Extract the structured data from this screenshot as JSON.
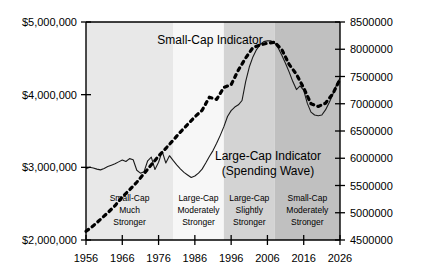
{
  "chart_data": {
    "type": "line",
    "title": "",
    "xlabel": "",
    "ylabel": "",
    "grid": false,
    "legend_position": "inline-annotations",
    "x_ticks": [
      1956,
      1966,
      1976,
      1986,
      1996,
      2006,
      2016,
      2026
    ],
    "x_tick_labels": [
      "1956",
      "1966",
      "1976",
      "1986",
      "1996",
      "2006",
      "2016",
      "2026"
    ],
    "xlim": [
      1956,
      2026
    ],
    "left_axis": {
      "tick_labels": [
        "$5,000,000",
        "$4,000,000",
        "$3,000,000",
        "$2,000,000"
      ],
      "tick_values": [
        5000000,
        4000000,
        3000000,
        2000000
      ],
      "ylim": [
        2000000,
        5000000
      ]
    },
    "right_axis": {
      "tick_labels": [
        "8500000",
        "8000000",
        "7500000",
        "7000000",
        "6500000",
        "6000000",
        "5500000",
        "5000000",
        "4500000"
      ],
      "tick_values": [
        8500000,
        8000000,
        7500000,
        7000000,
        6500000,
        6000000,
        5500000,
        5000000,
        4500000
      ],
      "ylim": [
        4500000,
        8500000
      ]
    },
    "series": [
      {
        "name": "Small-Cap Indicator",
        "style": "solid",
        "axis": "left",
        "label": "Small-Cap Indicator",
        "x": [
          1956,
          1957,
          1958,
          1959,
          1960,
          1961,
          1962,
          1963,
          1964,
          1965,
          1966,
          1967,
          1968,
          1969,
          1970,
          1971,
          1972,
          1973,
          1974,
          1975,
          1976,
          1977,
          1978,
          1979,
          1980,
          1981,
          1982,
          1983,
          1984,
          1985,
          1986,
          1987,
          1988,
          1989,
          1990,
          1991,
          1992,
          1993,
          1994,
          1995,
          1996,
          1997,
          1998,
          1999,
          2000,
          2001,
          2002,
          2003,
          2004,
          2005,
          2006,
          2007,
          2008,
          2009,
          2010,
          2011,
          2012,
          2013,
          2014,
          2015,
          2016,
          2017,
          2018,
          2019,
          2020,
          2021,
          2022,
          2023,
          2024,
          2025,
          2026
        ],
        "y": [
          2980000,
          3000000,
          2990000,
          2975000,
          2965000,
          2985000,
          3010000,
          3030000,
          3050000,
          3075000,
          3100000,
          3080000,
          3120000,
          3105000,
          2960000,
          2920000,
          2940000,
          3090000,
          3140000,
          2970000,
          3070000,
          3220000,
          3060000,
          3160000,
          3095000,
          3035000,
          2980000,
          2930000,
          2895000,
          2860000,
          2880000,
          2920000,
          2975000,
          3060000,
          3150000,
          3230000,
          3330000,
          3440000,
          3560000,
          3700000,
          3780000,
          3830000,
          3860000,
          3920000,
          4180000,
          4380000,
          4520000,
          4620000,
          4690000,
          4730000,
          4740000,
          4740000,
          4710000,
          4640000,
          4540000,
          4430000,
          4310000,
          4180000,
          4070000,
          4120000,
          4060000,
          3880000,
          3760000,
          3720000,
          3710000,
          3720000,
          3790000,
          3890000,
          4000000,
          4130000,
          4230000
        ]
      },
      {
        "name": "Large-Cap Indicator (Spending Wave)",
        "style": "dotted",
        "axis": "right",
        "label_line1": "Large-Cap Indicator",
        "label_line2": "(Spending Wave)",
        "x": [
          1956,
          1958,
          1960,
          1962,
          1964,
          1966,
          1968,
          1970,
          1972,
          1974,
          1976,
          1978,
          1980,
          1982,
          1984,
          1986,
          1988,
          1990,
          1992,
          1994,
          1996,
          1998,
          2000,
          2002,
          2004,
          2006,
          2008,
          2010,
          2012,
          2014,
          2016,
          2018,
          2020,
          2022,
          2024,
          2026
        ],
        "y": [
          4660000,
          4760000,
          4880000,
          5000000,
          5130000,
          5290000,
          5420000,
          5560000,
          5720000,
          5880000,
          6040000,
          6180000,
          6330000,
          6480000,
          6620000,
          6760000,
          6880000,
          7120000,
          7080000,
          7300000,
          7350000,
          7620000,
          7840000,
          8030000,
          8080000,
          8110000,
          8130000,
          7990000,
          7720000,
          7540000,
          7290000,
          7000000,
          6950000,
          7010000,
          7180000,
          7450000
        ]
      }
    ],
    "bands": [
      {
        "label_lines": [
          "Small-Cap",
          "Much",
          "Stronger"
        ],
        "x_start": 1956,
        "x_end": 1980,
        "shade": "#e8e8e8"
      },
      {
        "label_lines": [
          "Large-Cap",
          "Moderately",
          "Stronger"
        ],
        "x_start": 1980,
        "x_end": 1994,
        "shade": "#f7f7f7"
      },
      {
        "label_lines": [
          "Large-Cap",
          "Slightly",
          "Stronger"
        ],
        "x_start": 1994,
        "x_end": 2008,
        "shade": "#d3d3d3"
      },
      {
        "label_lines": [
          "Small-Cap",
          "Moderately",
          "Stronger"
        ],
        "x_start": 2008,
        "x_end": 2026,
        "shade": "#c0c0c0"
      }
    ]
  },
  "colors": {
    "axis": "#000000",
    "series_solid": "#1a1a1a",
    "series_dotted": "#000000",
    "background": "#ffffff"
  }
}
